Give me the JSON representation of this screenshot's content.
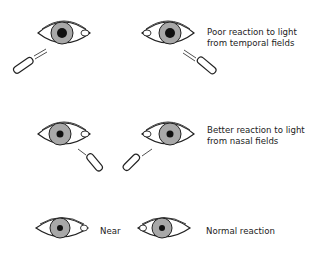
{
  "diagram": {
    "rows": [
      {
        "label_lines": [
          "Poor reaction to light",
          "from temporal fields"
        ],
        "eyes": [
          "left-eye-light-from-lower-left",
          "right-eye-light-from-lower-right"
        ]
      },
      {
        "label_lines": [
          "Better reaction to light",
          "from nasal fields"
        ],
        "eyes": [
          "left-eye-light-from-lower-right",
          "right-eye-light-from-lower-left"
        ]
      },
      {
        "label_middle": "Near",
        "label_right": "Normal reaction",
        "eyes": [
          "left-eye",
          "right-eye"
        ]
      }
    ],
    "colors": {
      "iris": "#a8a8a8",
      "pupil": "#111111",
      "line": "#222222"
    }
  }
}
